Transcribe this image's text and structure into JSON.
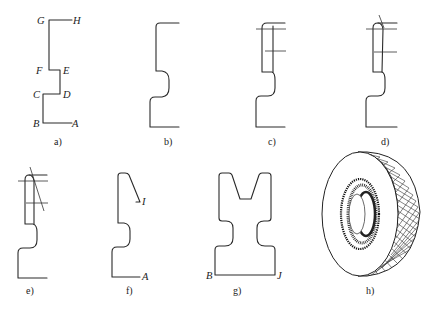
{
  "figure": {
    "panels": [
      {
        "id": "a",
        "caption": "a)",
        "points": {
          "G": "G",
          "H": "H",
          "F": "F",
          "E": "E",
          "C": "C",
          "D": "D",
          "B": "B",
          "A": "A"
        }
      },
      {
        "id": "b",
        "caption": "b)"
      },
      {
        "id": "c",
        "caption": "c)"
      },
      {
        "id": "d",
        "caption": "d)"
      },
      {
        "id": "e",
        "caption": "e)"
      },
      {
        "id": "f",
        "caption": "f)",
        "points": {
          "I": "I",
          "A": "A"
        }
      },
      {
        "id": "g",
        "caption": "g)",
        "points": {
          "B": "B",
          "J": "J"
        }
      },
      {
        "id": "h",
        "caption": "h)"
      }
    ]
  }
}
